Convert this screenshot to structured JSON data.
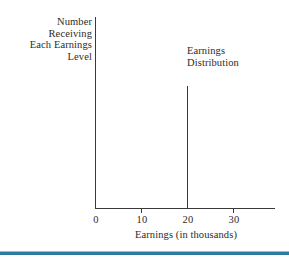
{
  "figure": {
    "background_color": "#ffffff",
    "ink_color": "#3a3a3a",
    "accent_color": "#2e7ba0"
  },
  "chart_data": {
    "type": "bar",
    "title": "",
    "subtitle": "",
    "xlabel": "Earnings (in thousands)",
    "ylabel_lines": [
      "Number",
      "Receiving",
      "Each Earnings",
      "Level"
    ],
    "ylabel": "Number Receiving Each Earnings Level",
    "series": [
      {
        "name": "Earnings Distribution",
        "x": [
          20
        ],
        "values": [
          1.0
        ],
        "note": "Single vertical spike at x = 20; all workers receive exactly 20 thousand."
      }
    ],
    "annotations": [
      {
        "text_lines": [
          "Earnings",
          "Distribution"
        ],
        "text": "Earnings Distribution",
        "x": 20,
        "anchor": "left"
      }
    ],
    "x_ticks": [
      0,
      10,
      20,
      30
    ],
    "x_tick_labels": [
      "0",
      "10",
      "20",
      "30"
    ],
    "xlim": [
      0,
      39
    ],
    "y_ticks": [],
    "y_tick_labels": [],
    "ylim": [
      0,
      1.57
    ],
    "grid": false,
    "legend": "none",
    "legend_position": "none"
  },
  "axis": {
    "y_caption": {
      "line1": "Number",
      "line2": "Receiving",
      "line3": "Each Earnings",
      "line4": "Level"
    },
    "x_caption": "Earnings (in thousands)",
    "tick_labels": {
      "t0": "0",
      "t10": "10",
      "t20": "20",
      "t30": "30"
    }
  },
  "annotation": {
    "series_label": {
      "line1": "Earnings",
      "line2": "Distribution"
    }
  }
}
